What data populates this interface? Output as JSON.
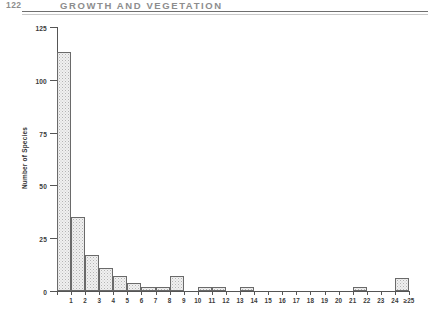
{
  "page": {
    "folio": "122",
    "running_head": "GROWTH AND VEGETATION"
  },
  "chart_data": {
    "type": "bar",
    "title": "",
    "xlabel": "",
    "ylabel": "Number of Species",
    "categories": [
      "1",
      "2",
      "3",
      "4",
      "5",
      "6",
      "7",
      "8",
      "9",
      "10",
      "11",
      "12",
      "13",
      "14",
      "15",
      "16",
      "17",
      "18",
      "19",
      "20",
      "21",
      "22",
      "23",
      "24",
      "≥25"
    ],
    "values": [
      113,
      35,
      17,
      11,
      7,
      4,
      2,
      2,
      7,
      0,
      2,
      2,
      0,
      2,
      0,
      0,
      0,
      0,
      0,
      0,
      0,
      2,
      0,
      0,
      6
    ],
    "ylim": [
      0,
      125
    ],
    "yticks": [
      0,
      25,
      50,
      75,
      100,
      125
    ],
    "ytick_labels": [
      "0",
      "25",
      "50",
      "75",
      "100",
      "125"
    ],
    "xlim": [
      0,
      25
    ],
    "grid": false,
    "legend": null,
    "bar_style": "stippled-fill-outlined"
  }
}
